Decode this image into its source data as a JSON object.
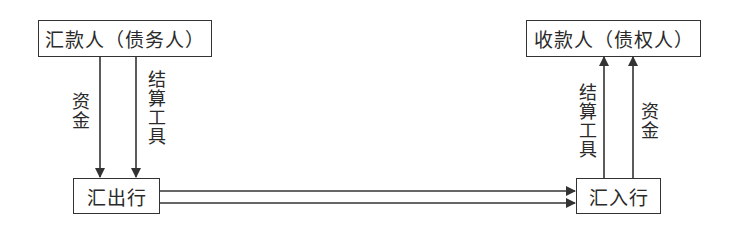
{
  "diagram": {
    "nodes": {
      "remitter": {
        "label": "汇款人（债务人）"
      },
      "payee": {
        "label": "收款人（债权人）"
      },
      "remitting_bank": {
        "label": "汇出行"
      },
      "receiving_bank": {
        "label": "汇入行"
      }
    },
    "edges": [
      {
        "from": "remitter",
        "to": "remitting_bank",
        "label": "资金"
      },
      {
        "from": "remitter",
        "to": "remitting_bank",
        "label": "结算工具"
      },
      {
        "from": "remitting_bank",
        "to": "receiving_bank",
        "label": ""
      },
      {
        "from": "remitting_bank",
        "to": "receiving_bank",
        "label": ""
      },
      {
        "from": "receiving_bank",
        "to": "payee",
        "label": "结算工具"
      },
      {
        "from": "receiving_bank",
        "to": "payee",
        "label": "资金"
      }
    ],
    "labels": {
      "left_funds": "资金",
      "left_instrument": "结算工具",
      "right_instrument": "结算工具",
      "right_funds": "资金"
    },
    "colors": {
      "line": "#333333",
      "text": "#2a2a2a",
      "background": "#ffffff"
    }
  }
}
